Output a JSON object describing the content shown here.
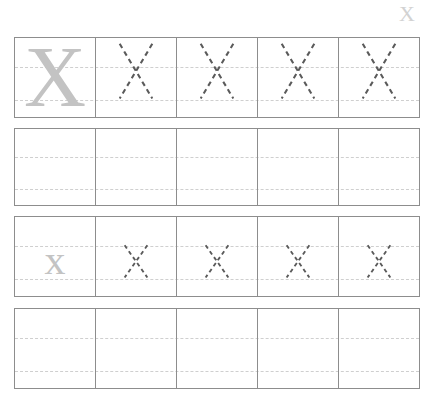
{
  "worksheet": {
    "letter": "X",
    "title": "Letter X handwriting tracing practice worksheet",
    "header": {
      "letter_label": "X"
    },
    "colors": {
      "model_glyph": "#c3c3c3",
      "trace_stroke": "#5a5a5a",
      "guideline": "#cfcfcf",
      "cell_border": "#8d8d8d",
      "header_letter": "#d2d2d2",
      "page_background": "#ffffff"
    },
    "columns": 5,
    "rows": [
      {
        "name": "uppercase-model-row",
        "case": "uppercase",
        "size": "large",
        "cells": [
          {
            "type": "model",
            "letter": "X"
          },
          {
            "type": "trace",
            "letter": "X"
          },
          {
            "type": "trace",
            "letter": "X"
          },
          {
            "type": "trace",
            "letter": "X"
          },
          {
            "type": "trace",
            "letter": "X"
          }
        ]
      },
      {
        "name": "uppercase-blank-row",
        "case": "uppercase",
        "size": "large",
        "cells": [
          {
            "type": "blank",
            "letter": ""
          },
          {
            "type": "blank",
            "letter": ""
          },
          {
            "type": "blank",
            "letter": ""
          },
          {
            "type": "blank",
            "letter": ""
          },
          {
            "type": "blank",
            "letter": ""
          }
        ]
      },
      {
        "name": "lowercase-model-row",
        "case": "lowercase",
        "size": "small",
        "cells": [
          {
            "type": "model",
            "letter": "x"
          },
          {
            "type": "trace",
            "letter": "x"
          },
          {
            "type": "trace",
            "letter": "x"
          },
          {
            "type": "trace",
            "letter": "x"
          },
          {
            "type": "trace",
            "letter": "x"
          }
        ]
      },
      {
        "name": "lowercase-blank-row",
        "case": "lowercase",
        "size": "small",
        "cells": [
          {
            "type": "blank",
            "letter": ""
          },
          {
            "type": "blank",
            "letter": ""
          },
          {
            "type": "blank",
            "letter": ""
          },
          {
            "type": "blank",
            "letter": ""
          },
          {
            "type": "blank",
            "letter": ""
          }
        ]
      }
    ]
  }
}
